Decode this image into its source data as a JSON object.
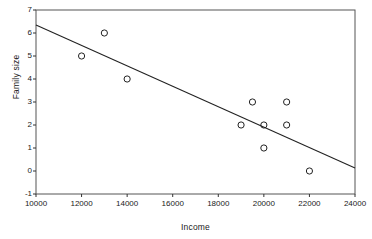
{
  "chart_data": {
    "type": "scatter",
    "title": "",
    "xlabel": "Income",
    "ylabel": "Family size",
    "xlim": [
      10000,
      24000
    ],
    "ylim": [
      -1,
      7
    ],
    "xticks": [
      10000,
      12000,
      14000,
      16000,
      18000,
      20000,
      22000,
      24000
    ],
    "xticklabels": [
      "10000",
      "12000",
      "14000",
      "16000",
      "18000",
      "20000",
      "22000",
      "24000"
    ],
    "yticks": [
      -1,
      0,
      1,
      2,
      3,
      4,
      5,
      6,
      7
    ],
    "yticklabels": [
      "-1",
      "0",
      "1",
      "2",
      "3",
      "4",
      "5",
      "6",
      "7"
    ],
    "grid": false,
    "legend": null,
    "marker": "open-circle",
    "marker_color": "#222222",
    "line_color": "#222222",
    "series": [
      {
        "name": "observations",
        "x": [
          12000,
          13000,
          14000,
          19000,
          19500,
          20000,
          20000,
          21000,
          21000,
          22000
        ],
        "y": [
          5,
          6,
          4,
          2,
          3,
          2,
          1,
          3,
          2,
          0
        ]
      }
    ],
    "fit_line": {
      "name": "regression line",
      "x": [
        10000,
        24000
      ],
      "y": [
        6.35,
        0.13
      ]
    }
  }
}
